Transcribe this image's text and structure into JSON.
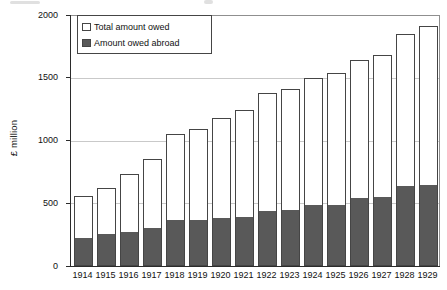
{
  "chart_data": {
    "type": "bar",
    "subtype": "overlay-stacked-bars",
    "title": "",
    "ylabel": "£ million",
    "xlabel": "",
    "ylim": [
      0,
      2000
    ],
    "yticks": [
      0,
      500,
      1000,
      1500,
      2000
    ],
    "grid": "horizontal",
    "legend_position": "top-left",
    "categories": [
      "1914",
      "1915",
      "1916",
      "1917",
      "1918",
      "1919",
      "1920",
      "1921",
      "1922",
      "1923",
      "1924",
      "1925",
      "1926",
      "1927",
      "1928",
      "1929"
    ],
    "series": [
      {
        "name": "Total amount owed",
        "fill": "#ffffff",
        "values": [
          560,
          625,
          730,
          850,
          1050,
          1090,
          1180,
          1245,
          1380,
          1410,
          1500,
          1535,
          1640,
          1680,
          1850,
          1910
        ]
      },
      {
        "name": "Amount owed abroad",
        "fill": "#595959",
        "values": [
          225,
          255,
          275,
          305,
          370,
          370,
          385,
          390,
          440,
          450,
          490,
          485,
          540,
          550,
          640,
          645
        ]
      }
    ]
  },
  "colors": {
    "bar_border": "#454545",
    "abroad_fill": "#595959",
    "gridline": "#c9c9c9",
    "axis": "#2b2b2b",
    "frame": "#8f8f8f",
    "text": "#111111"
  }
}
